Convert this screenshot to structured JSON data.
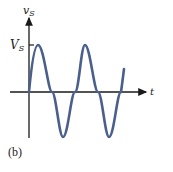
{
  "figure": {
    "caption": "(b)",
    "y_axis_label": "v",
    "y_axis_label_sub": "S",
    "x_axis_label": "t",
    "amplitude_label": "V",
    "amplitude_label_sub": "S",
    "curve_color": "#4a5f8c",
    "axis_color": "#1a1a1a"
  }
}
